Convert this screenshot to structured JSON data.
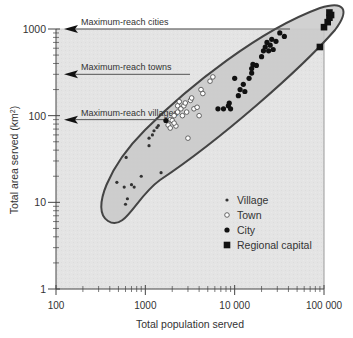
{
  "chart_data": {
    "type": "scatter",
    "title": "",
    "xlabel": "Total population served",
    "ylabel": "Total area served (km²)",
    "xscale": "log",
    "yscale": "log",
    "xlim": [
      100,
      100000
    ],
    "ylim": [
      1,
      1000
    ],
    "x_ticks": [
      {
        "value": 100,
        "label": "100"
      },
      {
        "value": 1000,
        "label": "1000"
      },
      {
        "value": 10000,
        "label": "10 000"
      },
      {
        "value": 100000,
        "label": "100 000"
      }
    ],
    "y_ticks": [
      {
        "value": 1,
        "label": "1"
      },
      {
        "value": 10,
        "label": "10"
      },
      {
        "value": 100,
        "label": "100"
      },
      {
        "value": 1000,
        "label": "1000"
      }
    ],
    "grid": false,
    "legend_position": "lower right inside plot",
    "legend": [
      {
        "name": "Village",
        "marker": "small-dark-dot"
      },
      {
        "name": "Town",
        "marker": "open-circle"
      },
      {
        "name": "City",
        "marker": "filled-circle"
      },
      {
        "name": "Regional capital",
        "marker": "filled-square"
      }
    ],
    "annotations": [
      {
        "text": "Maximum-reach cities",
        "y_value": 1000
      },
      {
        "text": "Maximum-reach towns",
        "y_value": 300
      },
      {
        "text": "Maximum-reach villages",
        "y_value": 90
      }
    ],
    "envelope": {
      "description": "Shaded ellipse enclosing all settlements from ~450 pop / ~9 km² to ~120 000 pop / ~1500 km²"
    },
    "series": [
      {
        "name": "Village",
        "points": [
          [
            480,
            17
          ],
          [
            610,
            33
          ],
          [
            580,
            15
          ],
          [
            700,
            16
          ],
          [
            750,
            15
          ],
          [
            630,
            11
          ],
          [
            600,
            9.5
          ],
          [
            1100,
            45
          ],
          [
            1100,
            55
          ],
          [
            1200,
            60
          ],
          [
            1250,
            67
          ],
          [
            1350,
            73
          ],
          [
            1500,
            22
          ],
          [
            1400,
            77
          ],
          [
            900,
            20
          ]
        ]
      },
      {
        "name": "Town",
        "points": [
          [
            1800,
            78
          ],
          [
            1900,
            72
          ],
          [
            1900,
            90
          ],
          [
            2000,
            88
          ],
          [
            2100,
            100
          ],
          [
            2200,
            76
          ],
          [
            2300,
            110
          ],
          [
            2300,
            130
          ],
          [
            2500,
            120
          ],
          [
            2400,
            145
          ],
          [
            2700,
            130
          ],
          [
            2800,
            140
          ],
          [
            2600,
            100
          ],
          [
            2900,
            110
          ],
          [
            3000,
            55
          ],
          [
            3200,
            150
          ],
          [
            3500,
            120
          ],
          [
            3800,
            125
          ],
          [
            4200,
            200
          ],
          [
            4400,
            180
          ],
          [
            4000,
            100
          ],
          [
            5300,
            250
          ],
          [
            5700,
            280
          ],
          [
            3300,
            160
          ],
          [
            2100,
            82
          ]
        ]
      },
      {
        "name": "City",
        "points": [
          [
            1700,
            88
          ],
          [
            6500,
            120
          ],
          [
            7500,
            120
          ],
          [
            8500,
            130
          ],
          [
            8700,
            140
          ],
          [
            9000,
            120
          ],
          [
            11000,
            170
          ],
          [
            11500,
            200
          ],
          [
            12500,
            230
          ],
          [
            13000,
            190
          ],
          [
            10000,
            270
          ],
          [
            14500,
            270
          ],
          [
            15500,
            350
          ],
          [
            16000,
            390
          ],
          [
            17500,
            380
          ],
          [
            15500,
            310
          ],
          [
            20000,
            480
          ],
          [
            21000,
            560
          ],
          [
            22000,
            620
          ],
          [
            23000,
            700
          ],
          [
            24000,
            560
          ],
          [
            25000,
            650
          ],
          [
            27000,
            580
          ],
          [
            26000,
            760
          ],
          [
            29000,
            720
          ],
          [
            32000,
            900
          ],
          [
            36000,
            820
          ]
        ]
      },
      {
        "name": "Regional capital",
        "points": [
          [
            90000,
            620
          ],
          [
            100000,
            1050
          ],
          [
            110000,
            1200
          ],
          [
            115000,
            1350
          ],
          [
            120000,
            1450
          ],
          [
            115000,
            1550
          ]
        ]
      }
    ]
  }
}
